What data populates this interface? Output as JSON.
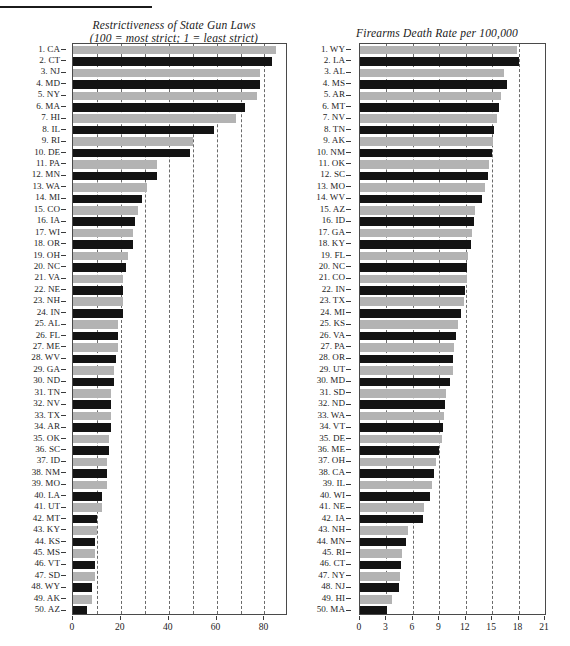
{
  "figure": {
    "rule_label": "header-rule",
    "background": "#ffffff",
    "bar_color_dark": "#131313",
    "bar_color_light": "#b3b3b3",
    "axis_color": "#4a4a4a"
  },
  "chart_data": [
    {
      "id": "restrictiveness",
      "type": "bar",
      "orientation": "horizontal",
      "title": "Restrictiveness of State Gun Laws\n(100 = most strict; 1 = least strict)",
      "title_line1": "Restrictiveness of State Gun Laws",
      "title_line2": "(100 = most strict; 1 = least strict)",
      "xlabel": "",
      "ylabel": "",
      "xlim": [
        0,
        89
      ],
      "xticks": [
        0,
        20,
        40,
        60,
        80
      ],
      "xtick_labels": [
        "0",
        "20",
        "40",
        "60",
        "80"
      ],
      "gridlines": [
        10,
        20,
        30,
        40,
        50,
        60,
        70,
        80
      ],
      "grid": true,
      "legend": "none",
      "categories": [
        "1. CA",
        "2. CT",
        "3. NJ",
        "4. MD",
        "5. NY",
        "6. MA",
        "7. HI",
        "8. IL",
        "9. RI",
        "10. DE",
        "11. PA",
        "12. MN",
        "13. WA",
        "14. MI",
        "15. CO",
        "16. IA",
        "17. WI",
        "18. OR",
        "19. OH",
        "20. NC",
        "21. VA",
        "22. NE",
        "23. NH",
        "24. IN",
        "25. AL",
        "26. FL",
        "27. ME",
        "28. WV",
        "29. GA",
        "30. ND",
        "31. TN",
        "32. NV",
        "33. TX",
        "34. AR",
        "35. OK",
        "36. SC",
        "37. ID",
        "38. NM",
        "39. MO",
        "40. LA",
        "41. UT",
        "42. MT",
        "43. KY",
        "44. KS",
        "45. MS",
        "46. VT",
        "47. SD",
        "48. WY",
        "49. AK",
        "50. AZ"
      ],
      "values": [
        85,
        83,
        78,
        78,
        77,
        72,
        68,
        59,
        50,
        49,
        35,
        35,
        31,
        29,
        27,
        26,
        25,
        25,
        23,
        22,
        21,
        21,
        21,
        21,
        19,
        19,
        19,
        18,
        17,
        17,
        16,
        16,
        16,
        16,
        15,
        15,
        14,
        14,
        14,
        12,
        12,
        10,
        10,
        9,
        9,
        9,
        9,
        8,
        8,
        6
      ]
    },
    {
      "id": "firearms-death-rate",
      "type": "bar",
      "orientation": "horizontal",
      "title": "Firearms Death Rate per 100,000",
      "title_line1": "Firearms Death Rate per 100,000",
      "title_line2": "",
      "xlabel": "",
      "ylabel": "",
      "xlim": [
        0,
        21
      ],
      "xticks": [
        0,
        3,
        6,
        9,
        12,
        15,
        18,
        21
      ],
      "xtick_labels": [
        "0",
        "3",
        "6",
        "9",
        "12",
        "15",
        "18",
        "21"
      ],
      "gridlines": [
        3,
        6,
        9,
        12,
        15,
        18
      ],
      "grid": true,
      "legend": "none",
      "categories": [
        "1. WY",
        "2. LA",
        "3. AL",
        "4. MS",
        "5. AR",
        "6. MT",
        "7. NV",
        "8. TN",
        "9. AK",
        "10. NM",
        "11. OK",
        "12. SC",
        "13. MO",
        "14. WV",
        "15. AZ",
        "16. ID",
        "17. GA",
        "18. KY",
        "19. FL",
        "20. NC",
        "21. CO",
        "22. IN",
        "23. TX",
        "24. MI",
        "25. KS",
        "26. VA",
        "27. PA",
        "28. OR",
        "29. UT",
        "30. MD",
        "31. SD",
        "32. ND",
        "33. WA",
        "34. VT",
        "35. DE",
        "36. ME",
        "37. OH",
        "38. CA",
        "39. IL",
        "40. WI",
        "41. NE",
        "42. IA",
        "43. NH",
        "44. MN",
        "45. RI",
        "46. CT",
        "47. NY",
        "48. NJ",
        "49. HI",
        "50. MA"
      ],
      "values": [
        17.8,
        18.0,
        16.4,
        16.7,
        16.0,
        15.8,
        15.6,
        15.2,
        15.1,
        15.0,
        14.6,
        14.5,
        14.2,
        13.8,
        13.0,
        12.9,
        12.7,
        12.6,
        12.3,
        12.2,
        12.1,
        11.9,
        11.8,
        11.5,
        11.1,
        10.9,
        10.7,
        10.6,
        10.5,
        10.2,
        9.8,
        9.6,
        9.5,
        9.4,
        9.3,
        9.0,
        8.6,
        8.4,
        8.2,
        8.0,
        7.3,
        7.1,
        5.4,
        5.2,
        4.8,
        4.7,
        4.5,
        4.4,
        3.6,
        3.1
      ]
    }
  ]
}
